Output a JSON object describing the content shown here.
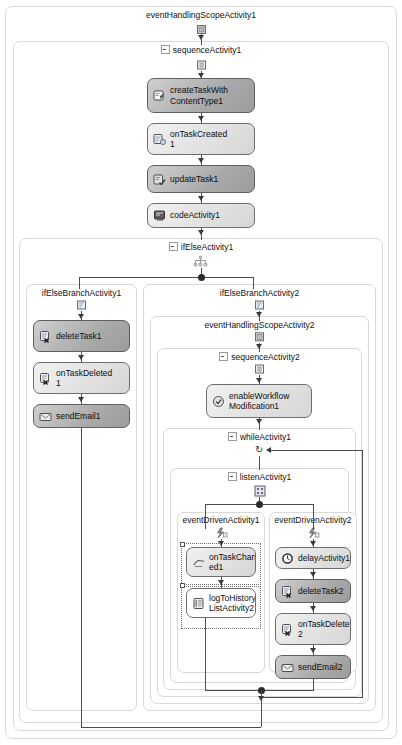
{
  "diagram": {
    "type": "workflow-designer",
    "tool": "Windows Workflow Foundation designer",
    "root": "eventHandlingScopeActivity1"
  },
  "scopes": {
    "eventHandlingScopeActivity1": {
      "label": "eventHandlingScopeActivity1",
      "icon": "event-handling-scope-icon"
    },
    "sequenceActivity1": {
      "label": "sequenceActivity1",
      "icon": "sequence-icon",
      "expander": true
    },
    "ifElseActivity1": {
      "label": "ifElseActivity1",
      "icon": "if-else-icon",
      "expander": true
    },
    "ifElseBranchActivity1": {
      "label": "ifElseBranchActivity1",
      "icon": "if-else-branch-icon"
    },
    "ifElseBranchActivity2": {
      "label": "ifElseBranchActivity2",
      "icon": "if-else-branch-icon"
    },
    "eventHandlingScopeActivity2": {
      "label": "eventHandlingScopeActivity2",
      "icon": "event-handling-scope-icon"
    },
    "sequenceActivity2": {
      "label": "sequenceActivity2",
      "icon": "sequence-icon",
      "expander": true
    },
    "whileActivity1": {
      "label": "whileActivity1",
      "icon": "loop-icon",
      "expander": true
    },
    "listenActivity1": {
      "label": "listenActivity1",
      "icon": "listen-icon",
      "expander": true
    },
    "eventDrivenActivity1": {
      "label": "eventDrivenActivity1",
      "icon": "event-driven-icon"
    },
    "eventDrivenActivity2": {
      "label": "eventDrivenActivity2",
      "icon": "event-driven-icon"
    }
  },
  "activities": [
    {
      "id": "createTaskWithContentType1",
      "line1": "createTaskWith",
      "line2": "ContentType1",
      "shade": "dark",
      "icon": "create-task-icon"
    },
    {
      "id": "onTaskCreated1",
      "line1": "onTaskCreated",
      "line2": "1",
      "shade": "light",
      "icon": "on-task-created-icon"
    },
    {
      "id": "updateTask1",
      "line1": "updateTask1",
      "line2": "",
      "shade": "dark",
      "icon": "update-task-icon"
    },
    {
      "id": "codeActivity1",
      "line1": "codeActivity1",
      "line2": "",
      "shade": "light",
      "icon": "code-icon"
    },
    {
      "id": "deleteTask1",
      "line1": "deleteTask1",
      "line2": "",
      "shade": "dark",
      "icon": "delete-task-icon"
    },
    {
      "id": "onTaskDeleted1",
      "line1": "onTaskDeleted",
      "line2": "1",
      "shade": "light",
      "icon": "on-task-deleted-icon"
    },
    {
      "id": "sendEmail1",
      "line1": "sendEmail1",
      "line2": "",
      "shade": "dark",
      "icon": "send-email-icon"
    },
    {
      "id": "enableWorkflowModification1",
      "line1": "enableWorkflow",
      "line2": "Modification1",
      "shade": "light",
      "icon": "enable-workflow-modification-icon"
    },
    {
      "id": "onTaskChanged1",
      "line1": "onTaskChang",
      "line2": "ed1",
      "shade": "light",
      "icon": "on-task-changed-icon"
    },
    {
      "id": "logToHistoryListActivity2",
      "line1": "logToHistory",
      "line2": "ListActivity2",
      "shade": "white",
      "icon": "log-to-history-icon"
    },
    {
      "id": "delayActivity1",
      "line1": "delayActivity1",
      "line2": "",
      "shade": "light",
      "icon": "delay-icon"
    },
    {
      "id": "deleteTask2",
      "line1": "deleteTask2",
      "line2": "",
      "shade": "dark",
      "icon": "delete-task-icon"
    },
    {
      "id": "onTaskDeleted2",
      "line1": "onTaskDeleted",
      "line2": "2",
      "shade": "light",
      "icon": "on-task-deleted-icon"
    },
    {
      "id": "sendEmail2",
      "line1": "sendEmail2",
      "line2": "",
      "shade": "dark",
      "icon": "send-email-icon"
    }
  ],
  "colors": {
    "box_border": "#6e6e6e",
    "box_dark_fill": "#aeaeae",
    "box_light_fill": "#e4e4e4",
    "scope_border": "#d8d8d8",
    "connector": "#4d4d4d",
    "canvas": "#ffffff",
    "text": "#111111"
  }
}
